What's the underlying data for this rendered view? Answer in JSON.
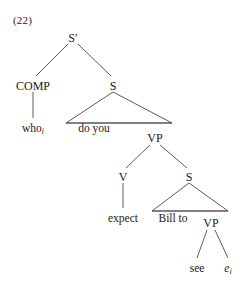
{
  "figure": {
    "example_number": "(22)",
    "type": "syntax-tree",
    "line_color": "#4a4a4a",
    "text_color": "#1a1a1a",
    "background_color": "#ffffff"
  },
  "nodes": {
    "root": {
      "label": "S′",
      "x": 73,
      "y": 38
    },
    "comp": {
      "label": "COMP",
      "x": 33,
      "y": 86
    },
    "s_matrix": {
      "label": "S",
      "x": 113,
      "y": 86
    },
    "vp_matrix": {
      "label": "VP",
      "x": 155,
      "y": 138
    },
    "v": {
      "label": "V",
      "x": 123,
      "y": 177
    },
    "s_embedded": {
      "label": "S",
      "x": 189,
      "y": 177
    },
    "vp_embedded": {
      "label": "VP",
      "x": 211,
      "y": 223
    }
  },
  "leaves": {
    "who": {
      "text": "who",
      "subscript": "i",
      "x": 33,
      "y": 128
    },
    "do_you": {
      "text": "do you",
      "x": 94,
      "y": 128
    },
    "expect": {
      "text": "expect",
      "x": 123,
      "y": 218
    },
    "bill_to": {
      "text": "Bill to",
      "x": 173,
      "y": 218
    },
    "see": {
      "text": "see",
      "x": 197,
      "y": 268
    },
    "trace": {
      "text": "e",
      "subscript": "i",
      "x": 228,
      "y": 268
    }
  },
  "edges": [
    {
      "from": "root",
      "to": "comp",
      "kind": "branch"
    },
    {
      "from": "root",
      "to": "s_matrix",
      "kind": "branch"
    },
    {
      "from": "comp",
      "to": "who",
      "kind": "stem"
    },
    {
      "from": "s_matrix",
      "to": "do_you_vp_span",
      "kind": "triangle"
    },
    {
      "from": "vp_matrix",
      "to": "v",
      "kind": "branch"
    },
    {
      "from": "vp_matrix",
      "to": "s_embedded",
      "kind": "branch"
    },
    {
      "from": "v",
      "to": "expect",
      "kind": "stem"
    },
    {
      "from": "s_embedded",
      "to": "bill_to_vp_span",
      "kind": "triangle"
    },
    {
      "from": "vp_embedded",
      "to": "see",
      "kind": "branch"
    },
    {
      "from": "vp_embedded",
      "to": "trace",
      "kind": "branch"
    }
  ]
}
